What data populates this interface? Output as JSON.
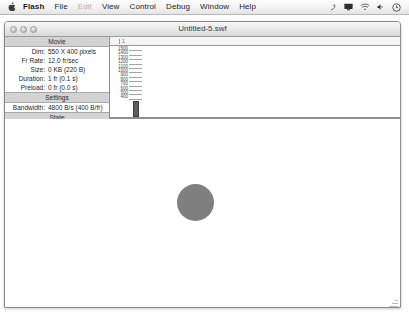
{
  "menubar": {
    "apple_icon": "apple-logo-icon",
    "items": [
      {
        "label": "Flash",
        "bold": true,
        "disabled": false
      },
      {
        "label": "File",
        "bold": false,
        "disabled": false
      },
      {
        "label": "Edit",
        "bold": false,
        "disabled": true
      },
      {
        "label": "View",
        "bold": false,
        "disabled": false
      },
      {
        "label": "Control",
        "bold": false,
        "disabled": false
      },
      {
        "label": "Debug",
        "bold": false,
        "disabled": false
      },
      {
        "label": "Window",
        "bold": false,
        "disabled": false
      },
      {
        "label": "Help",
        "bold": false,
        "disabled": false
      }
    ],
    "status_icons": [
      "bluetooth-icon",
      "display-icon",
      "airport-wifi-icon",
      "volume-icon",
      "clock-icon"
    ]
  },
  "window": {
    "title": "Untitled-5.swf",
    "traffic_lights": [
      "close-button",
      "minimize-button",
      "zoom-button"
    ]
  },
  "profiler": {
    "sections": {
      "movie_header": "Movie",
      "settings_header": "Settings",
      "state_header": "State"
    },
    "movie": [
      {
        "label": "Dim:",
        "value": "550 X 400 pixels"
      },
      {
        "label": "Fr Rate:",
        "value": "12.0 fr/sec"
      },
      {
        "label": "Size:",
        "value": "0 KB (220 B)"
      },
      {
        "label": "Duration:",
        "value": "1 fr (0.1 s)"
      },
      {
        "label": "Preload:",
        "value": "0 fr (0.0 s)"
      }
    ],
    "settings": [
      {
        "label": "Bandwidth:",
        "value": "4800 B/s (400 B/fr)"
      }
    ],
    "state": [
      {
        "label": "Frame:",
        "value": "1"
      }
    ]
  },
  "chart_data": {
    "type": "bar",
    "xlabel": "Frame",
    "ylabel": "Bytes",
    "categories": [
      "1"
    ],
    "values": [
      220
    ],
    "ytick_labels": [
      "1500",
      "1400",
      "1300",
      "1200",
      "1100",
      "1000",
      "900",
      "800",
      "700",
      "600",
      "500",
      "400"
    ],
    "ylim": [
      0,
      1600
    ],
    "xtick_labels": [
      "1"
    ],
    "grid": true,
    "legend": null,
    "bar_color": "#5f5f5f"
  },
  "stage": {
    "shape": {
      "name": "circle",
      "fill_color": "#7f7f7f",
      "diameter_px": 37
    }
  }
}
